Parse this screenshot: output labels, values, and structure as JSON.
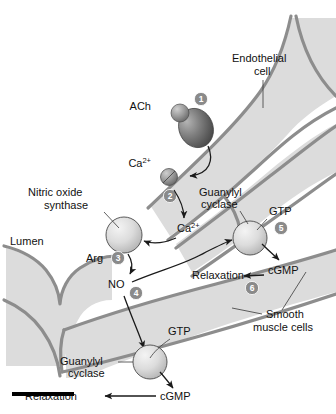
{
  "figure": {
    "colors": {
      "tissue_fill": "#dcdcdc",
      "wall_stroke": "#8d8d8d",
      "badge_fill": "#8a8a8a",
      "receptor_dark": "#6e6e6e",
      "enzyme_light": "#d2d2d2",
      "text": "#111111",
      "scalebar": "#000000"
    }
  },
  "labels": {
    "endothelial_cell": "Endothelial\ncell",
    "endothelial_cell_line1": "Endothelial",
    "endothelial_cell_line2": "cell",
    "lumen": "Lumen",
    "nitric_oxide_synthase_line1": "Nitric oxide",
    "nitric_oxide_synthase_line2": "synthase",
    "guanylyl_cyclase_upper_line1": "Guanylyl",
    "guanylyl_cyclase_upper_line2": "cyclase",
    "guanylyl_cyclase_lower_line1": "Guanylyl",
    "guanylyl_cyclase_lower_line2": "cyclase",
    "smooth_muscle_cells_line1": "Smooth",
    "smooth_muscle_cells_line2": "muscle cells"
  },
  "molecules": {
    "ach": "ACh",
    "calcium_outside_base": "Ca",
    "calcium_outside_sup": "2+",
    "calcium_inside_base": "Ca",
    "calcium_inside_sup": "2+",
    "arginine": "Arg",
    "nitric_oxide": "NO",
    "gtp_upper": "GTP",
    "cgmp_upper": "cGMP",
    "gtp_lower": "GTP",
    "cgmp_lower": "cGMP",
    "relaxation_upper": "Relaxation",
    "relaxation_lower": "Relaxation"
  },
  "steps": [
    {
      "id": 1,
      "label": "1"
    },
    {
      "id": 2,
      "label": "2"
    },
    {
      "id": 3,
      "label": "3"
    },
    {
      "id": 4,
      "label": "4"
    },
    {
      "id": 5,
      "label": "5"
    },
    {
      "id": 6,
      "label": "6"
    }
  ]
}
